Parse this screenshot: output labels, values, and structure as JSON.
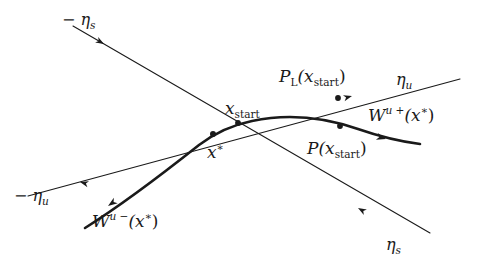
{
  "figure": {
    "background_color": "#ffffff",
    "ink_color": "#1a1a1a",
    "width": 479,
    "height": 267
  },
  "labels": {
    "minus_eta_s": {
      "text": "− η",
      "sub": "s",
      "x": 62,
      "y": 12
    },
    "minus_eta_u": {
      "text": "− η",
      "sub": "u",
      "x": 14,
      "y": 188
    },
    "eta_u": {
      "text": "η",
      "sub": "u",
      "x": 396,
      "y": 72
    },
    "eta_s": {
      "text": "η",
      "sub": "s",
      "x": 386,
      "y": 237
    },
    "x_start": {
      "text": "x",
      "sub": "start",
      "x": 225,
      "y": 100
    },
    "x_star": {
      "text": "x",
      "sup": "∗",
      "x": 207,
      "y": 142
    },
    "p_l_x_start": {
      "base": "P",
      "sub_base": "L",
      "arg": "(x",
      "sub_arg": "start",
      "close": ")",
      "x": 279,
      "y": 68
    },
    "p_x_start": {
      "base": "P",
      "arg": "(x",
      "sub_arg": "start",
      "close": ")",
      "x": 307,
      "y": 140
    },
    "w_u_plus": {
      "base": "W",
      "sup": "u +",
      "arg": "(x",
      "sup_arg": "∗",
      "close": ")",
      "x": 368,
      "y": 105
    },
    "w_u_minus": {
      "base": "W",
      "sup": "u −",
      "arg": "(x",
      "sup_arg": "∗",
      "close": ")",
      "x": 92,
      "y": 211
    }
  },
  "curves": {
    "eta_s_line": {
      "name": "stable-eigendirection-line",
      "path": "M 73 26 L 430 233",
      "stroke_width": 1.1
    },
    "eta_u_line": {
      "name": "unstable-eigendirection-line",
      "path": "M 28 196 L 460 79",
      "stroke_width": 1.1
    },
    "unstable_manifold": {
      "name": "unstable-manifold-curve",
      "path": "M 85 228 C 120 206 170 168 199 145 C 215 133 232 125 252 121 C 290 113 326 118 358 129 C 384 138 404 142 420 144",
      "stroke_width": 2.6
    }
  },
  "points": [
    {
      "name": "fixed-point-x-star",
      "x": 213,
      "y": 134,
      "r": 3.0
    },
    {
      "name": "point-x-start",
      "x": 238,
      "y": 123,
      "r": 2.9
    },
    {
      "name": "point-p-x-start",
      "x": 340,
      "y": 126,
      "r": 2.9
    },
    {
      "name": "point-p-l-x-start",
      "x": 338,
      "y": 98,
      "r": 2.9
    }
  ],
  "arrowheads": [
    {
      "name": "arrow-eta-s-upper",
      "x": 104,
      "y": 44,
      "angle": 30.1,
      "size": 8.5
    },
    {
      "name": "arrow-eta-s-lower",
      "x": 358,
      "y": 208,
      "angle": 210.1,
      "size": 8.5
    },
    {
      "name": "arrow-eta-u-left",
      "x": 80,
      "y": 182,
      "angle": 195.2,
      "size": 8.5
    },
    {
      "name": "arrow-eta-u-right",
      "x": 352,
      "y": 96,
      "angle": 344.8,
      "size": 8.5
    },
    {
      "name": "arrow-manifold-left",
      "x": 108,
      "y": 206,
      "angle": 145.0,
      "size": 9.5
    },
    {
      "name": "arrow-manifold-right",
      "x": 386,
      "y": 139,
      "angle": 16.0,
      "size": 9.5
    }
  ]
}
